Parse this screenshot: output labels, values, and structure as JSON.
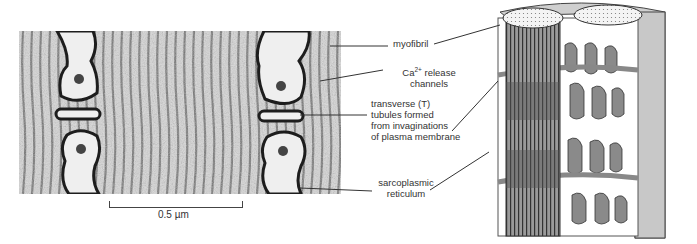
{
  "figure": {
    "micrograph": {
      "description": "electron micrograph of muscle fiber cross-section showing triads",
      "scale_bar": {
        "label": "0.5 µm"
      }
    },
    "labels": {
      "myofibril": "myofibril",
      "ca_release_line1": "Ca",
      "ca_release_sup": "2+",
      "ca_release_line1_rest": " release",
      "ca_release_line2": "channels",
      "t_tubules_line1": "transverse (T)",
      "t_tubules_line2": "tubules formed",
      "t_tubules_line3": "from invaginations",
      "t_tubules_line4": "of plasma membrane",
      "sr_line1": "sarcoplasmic",
      "sr_line2": "reticulum"
    },
    "drawing": {
      "description": "3D schematic of myofibrils surrounded by sarcoplasmic reticulum and T tubules"
    }
  }
}
